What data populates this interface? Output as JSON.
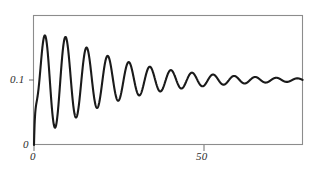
{
  "chart_data": {
    "type": "line",
    "title": "",
    "subtitle": "",
    "xlabel": "",
    "ylabel": "",
    "grid": false,
    "legend": null,
    "xlim": [
      0,
      79
    ],
    "ylim": [
      0,
      0.2
    ],
    "xticks": [
      {
        "value": 0,
        "label": "0"
      },
      {
        "value": 50,
        "label": "50"
      }
    ],
    "yticks": [
      {
        "value": 0,
        "label": "0"
      },
      {
        "value": 0.1,
        "label": "0.1"
      }
    ],
    "series": [
      {
        "name": "damped-oscillation",
        "color": "#1a1a1a",
        "asymptote": 0.1,
        "period": 6.2,
        "initial_amplitude": 0.105,
        "decay_constant": 0.048,
        "rise_constant": 2.2,
        "peaks": [
          {
            "x": 3.0,
            "y": 0.169
          },
          {
            "x": 9.2,
            "y": 0.152
          },
          {
            "x": 15.4,
            "y": 0.142
          },
          {
            "x": 21.6,
            "y": 0.134
          },
          {
            "x": 27.8,
            "y": 0.127
          },
          {
            "x": 34.0,
            "y": 0.121
          },
          {
            "x": 40.2,
            "y": 0.116
          },
          {
            "x": 46.4,
            "y": 0.112
          },
          {
            "x": 52.6,
            "y": 0.109
          },
          {
            "x": 58.8,
            "y": 0.106
          },
          {
            "x": 65.0,
            "y": 0.104
          },
          {
            "x": 71.2,
            "y": 0.102
          },
          {
            "x": 77.4,
            "y": 0.101
          }
        ],
        "troughs": [
          {
            "x": 6.1,
            "y": 0.018
          },
          {
            "x": 12.3,
            "y": 0.049
          },
          {
            "x": 18.5,
            "y": 0.06
          },
          {
            "x": 24.7,
            "y": 0.068
          },
          {
            "x": 30.9,
            "y": 0.075
          },
          {
            "x": 37.1,
            "y": 0.081
          },
          {
            "x": 43.3,
            "y": 0.085
          },
          {
            "x": 49.5,
            "y": 0.089
          },
          {
            "x": 55.7,
            "y": 0.092
          },
          {
            "x": 61.9,
            "y": 0.094
          },
          {
            "x": 68.1,
            "y": 0.096
          },
          {
            "x": 74.3,
            "y": 0.098
          }
        ]
      }
    ]
  },
  "axes": {
    "y_tick_high": "0.1",
    "y_tick_low": "0",
    "x_tick_origin": "0",
    "x_tick_mid": "50"
  },
  "colors": {
    "curve": "#1a1a1a",
    "frame": "#8c8c8c",
    "axis_text": "#2b2b2b",
    "background": "#ffffff"
  }
}
